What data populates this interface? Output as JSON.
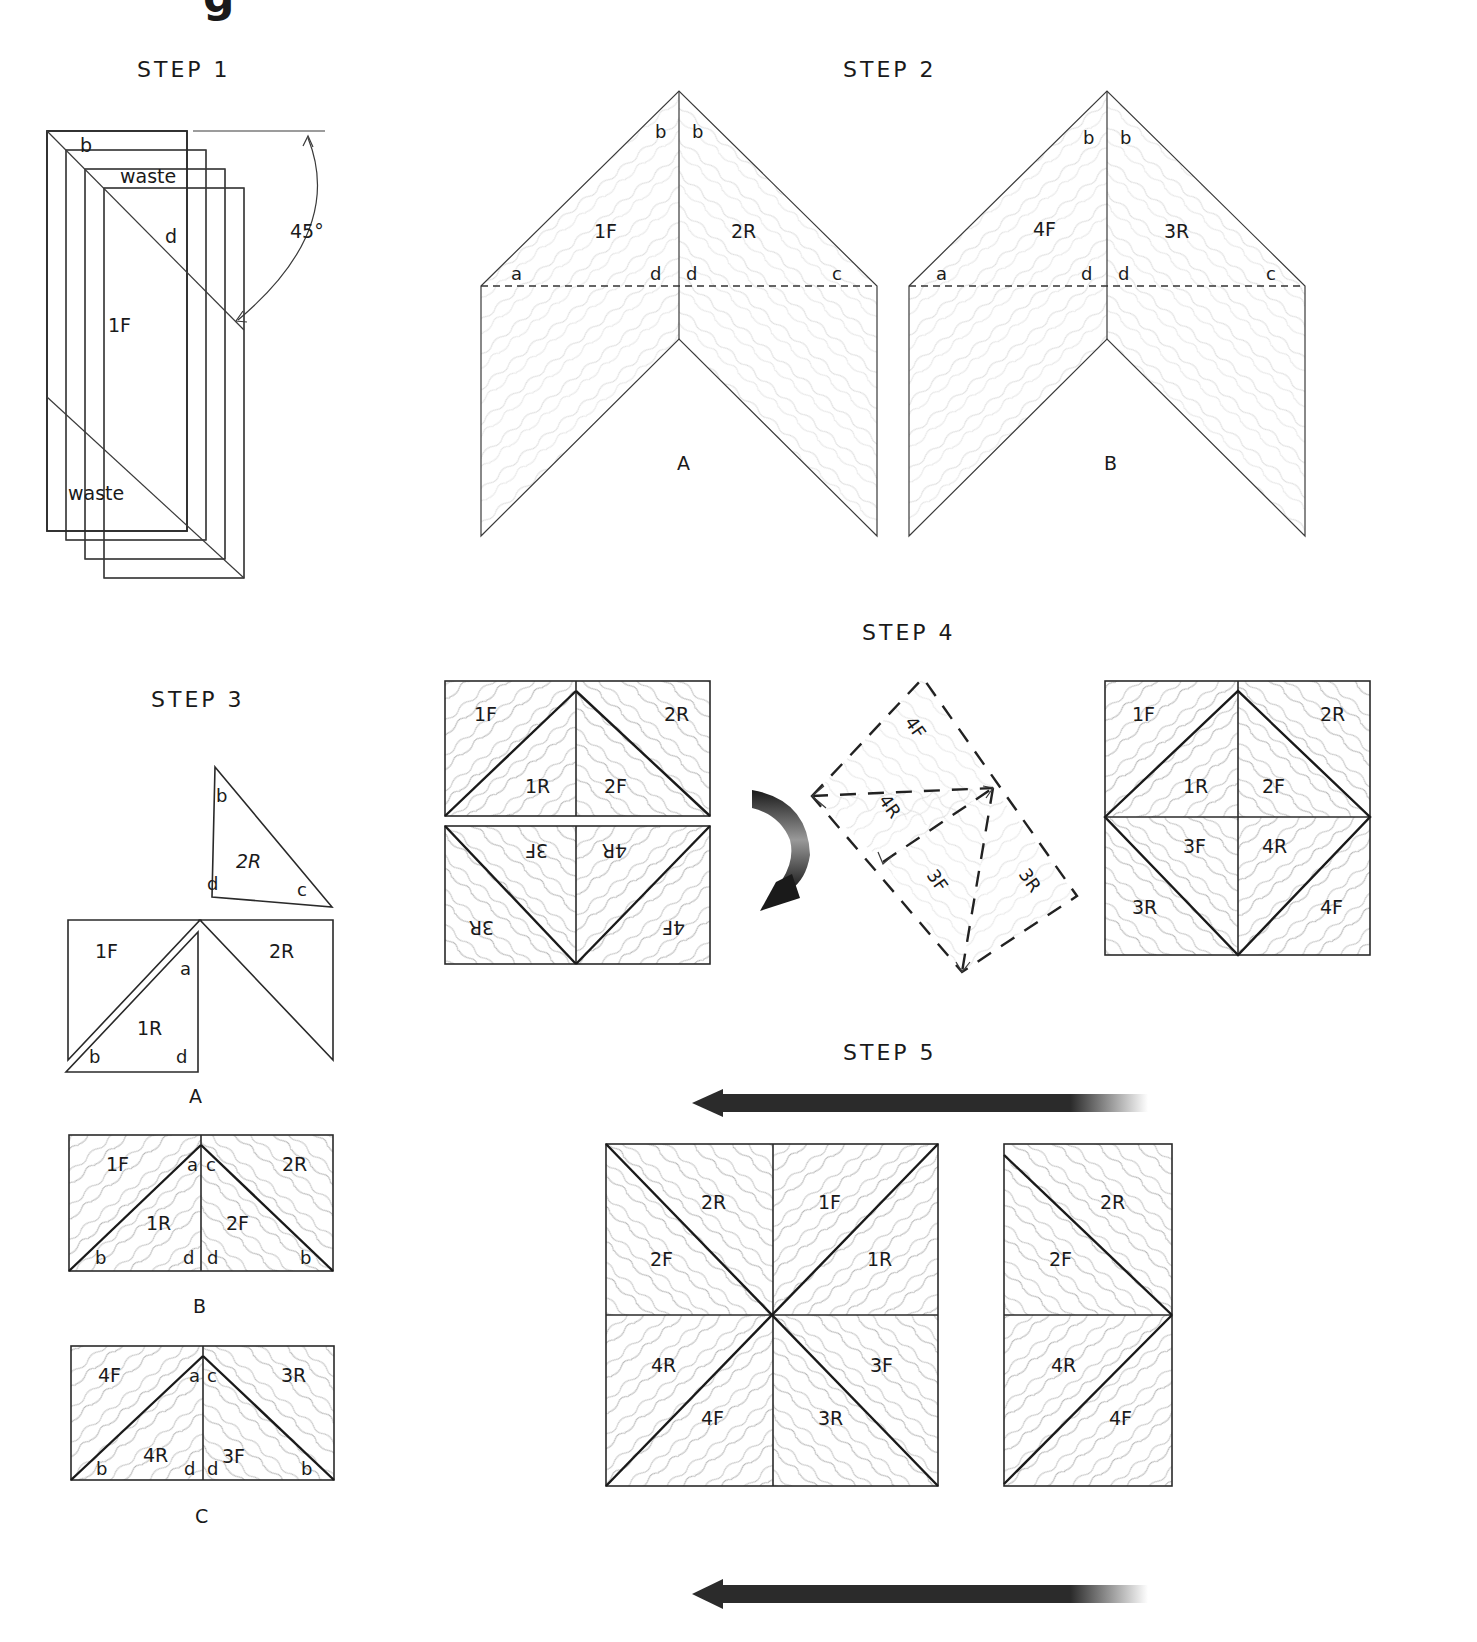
{
  "header": {
    "partial_glyph": "g"
  },
  "step1": {
    "title": "STEP 1",
    "labels": {
      "b": "b",
      "waste_top": "waste",
      "d": "d",
      "piece": "1F",
      "waste_bottom": "waste",
      "angle": "45°"
    }
  },
  "step2": {
    "title": "STEP 2",
    "A": {
      "caption": "A",
      "left": "1F",
      "right": "2R",
      "b1": "b",
      "b2": "b",
      "a": "a",
      "d1": "d",
      "d2": "d",
      "c": "c"
    },
    "B": {
      "caption": "B",
      "left": "4F",
      "right": "3R",
      "b1": "b",
      "b2": "b",
      "a": "a",
      "d1": "d",
      "d2": "d",
      "c": "c"
    }
  },
  "step3": {
    "title": "STEP 3",
    "A": {
      "caption": "A",
      "loose": {
        "piece": "2R",
        "b": "b",
        "d": "d",
        "c": "c"
      },
      "left": "1F",
      "inner": "1R",
      "right": "2R",
      "a": "a",
      "b": "b",
      "d": "d"
    },
    "B": {
      "caption": "B",
      "tl": "1F",
      "tr": "2R",
      "bl": "1R",
      "br": "2F",
      "a": "a",
      "c": "c",
      "b1": "b",
      "d1": "d",
      "d2": "d",
      "b2": "b"
    },
    "C": {
      "caption": "C",
      "tl": "4F",
      "tr": "3R",
      "bl": "4R",
      "br": "3F",
      "a": "a",
      "c": "c",
      "b1": "b",
      "d1": "d",
      "d2": "d",
      "b2": "b"
    }
  },
  "step4": {
    "title": "STEP 4",
    "left_top": {
      "tl": "1F",
      "tr": "2R",
      "bl": "1R",
      "br": "2F"
    },
    "left_bottom": {
      "tl": "3F",
      "tr": "4R",
      "bl": "3R",
      "br": "4F"
    },
    "rotated": {
      "p1": "4F",
      "p2": "4R",
      "p3": "3F",
      "p4": "3R"
    },
    "assembled": {
      "r1": [
        "1F",
        "2R"
      ],
      "r2": [
        "1R",
        "2F"
      ],
      "r3": [
        "3F",
        "4R"
      ],
      "r4": [
        "3R",
        "4F"
      ]
    }
  },
  "step5": {
    "title": "STEP 5",
    "big": {
      "top": [
        "2R",
        "1F"
      ],
      "upper": [
        "2F",
        "1R"
      ],
      "lower": [
        "4R",
        "3F"
      ],
      "bottom": [
        "4F",
        "3R"
      ]
    },
    "small": {
      "p1": "2R",
      "p2": "2F",
      "p3": "4R",
      "p4": "4F"
    },
    "arrow_color": "#2b2b2b"
  }
}
